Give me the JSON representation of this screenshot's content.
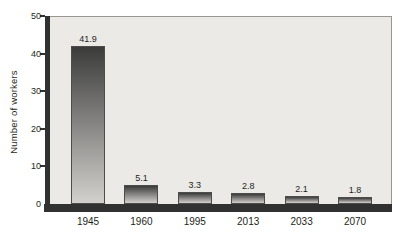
{
  "chart_data": {
    "type": "bar",
    "categories": [
      "1945",
      "1960",
      "1995",
      "2013",
      "2033",
      "2070"
    ],
    "values": [
      41.9,
      5.1,
      3.3,
      2.8,
      2.1,
      1.8
    ],
    "value_labels": [
      "41.9",
      "5.1",
      "3.3",
      "2.8",
      "2.1",
      "1.8"
    ],
    "title": "",
    "xlabel": "",
    "ylabel": "Number of workers",
    "ylim": [
      0,
      50
    ],
    "yticks": [
      0,
      10,
      20,
      30,
      40,
      50
    ],
    "grid": false,
    "legend": false,
    "colors": {
      "plot_bg": "#ebeae7",
      "plot_border": "#98968f",
      "axis": "#313131",
      "bar_top": "#3b3b39",
      "bar_bottom": "#d3d1ce",
      "bar_border": "#4c4c4a",
      "text": "#231f20"
    }
  }
}
